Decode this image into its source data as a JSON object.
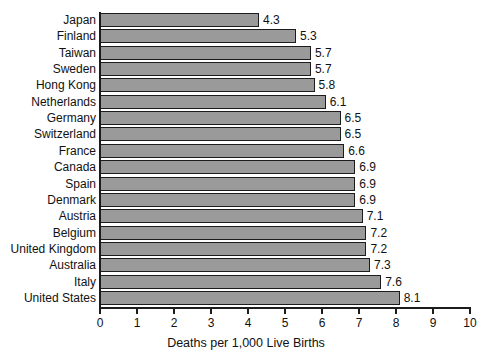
{
  "chart_data": {
    "type": "bar",
    "orientation": "horizontal",
    "title": "",
    "xlabel": "Deaths per 1,000 Live Births",
    "ylabel": "",
    "xlim": [
      0,
      10
    ],
    "xticks": [
      0,
      1,
      2,
      3,
      4,
      5,
      6,
      7,
      8,
      9,
      10
    ],
    "xtick_labels": [
      "0",
      "1",
      "2",
      "3",
      "4",
      "5",
      "6",
      "7",
      "8",
      "9",
      "10"
    ],
    "grid": false,
    "legend": null,
    "bar_color": "#9a9a9a",
    "bar_edge_color": "#1c1c1c",
    "axis_color": "#1c1c1c",
    "categories": [
      "Japan",
      "Finland",
      "Taiwan",
      "Sweden",
      "Hong Kong",
      "Netherlands",
      "Germany",
      "Switzerland",
      "France",
      "Canada",
      "Spain",
      "Denmark",
      "Austria",
      "Belgium",
      "United Kingdom",
      "Australia",
      "Italy",
      "United States"
    ],
    "values": [
      4.3,
      5.3,
      5.7,
      5.7,
      5.8,
      6.1,
      6.5,
      6.5,
      6.6,
      6.9,
      6.9,
      6.9,
      7.1,
      7.2,
      7.2,
      7.3,
      7.6,
      8.1
    ],
    "value_labels": [
      "4.3",
      "5.3",
      "5.7",
      "5.7",
      "5.8",
      "6.1",
      "6.5",
      "6.5",
      "6.6",
      "6.9",
      "6.9",
      "6.9",
      "7.1",
      "7.2",
      "7.2",
      "7.3",
      "7.6",
      "8.1"
    ]
  }
}
